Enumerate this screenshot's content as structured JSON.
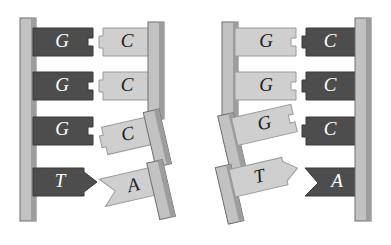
{
  "figure": {
    "background_color": "#ffffff"
  },
  "palette": {
    "backbone_face": "#b9b9b9",
    "backbone_edge": "#8d8d8d",
    "backbone_outline": "#6e6e6e",
    "base_dark": "#4d4d4d",
    "base_dark_outline": "#3a3a3a",
    "base_light": "#cfcfcf",
    "base_light_outline": "#9a9a9a",
    "label_on_dark": "#ffffff",
    "label_on_light": "#1c1c1c"
  },
  "groups": [
    {
      "id": "left-fragment",
      "name": "left-dna-fragment",
      "backbones": [
        {
          "id": "left-outer-backbone",
          "name": "backbone-left-outer",
          "state": "intact",
          "tilt_deg": 0
        },
        {
          "id": "left-inner-backbone-top",
          "name": "backbone-left-inner-top",
          "state": "intact",
          "tilt_deg": 0
        },
        {
          "id": "left-inner-backbone-frag-3",
          "name": "backbone-fragment-row3",
          "state": "detached",
          "tilt_deg": -14
        },
        {
          "id": "left-inner-backbone-frag-4",
          "name": "backbone-fragment-row4",
          "state": "detached",
          "tilt_deg": -14
        }
      ],
      "rows": [
        {
          "row": 1,
          "state": "paired",
          "tilt_deg": 0,
          "left": {
            "base": "G",
            "shade": "dark",
            "connector": "notch"
          },
          "right": {
            "base": "C",
            "shade": "light",
            "connector": "tab"
          }
        },
        {
          "row": 2,
          "state": "paired",
          "tilt_deg": 0,
          "left": {
            "base": "G",
            "shade": "dark",
            "connector": "notch"
          },
          "right": {
            "base": "C",
            "shade": "light",
            "connector": "tab"
          }
        },
        {
          "row": 3,
          "state": "separated",
          "tilt_deg": -14,
          "left": {
            "base": "G",
            "shade": "dark",
            "connector": "notch"
          },
          "right": {
            "base": "C",
            "shade": "light",
            "connector": "tab"
          }
        },
        {
          "row": 4,
          "state": "separated",
          "tilt_deg": -14,
          "left": {
            "base": "T",
            "shade": "dark",
            "connector": "arrow-point"
          },
          "right": {
            "base": "A",
            "shade": "light",
            "connector": "v-notch"
          }
        }
      ]
    },
    {
      "id": "right-fragment",
      "name": "right-dna-fragment",
      "backbones": [
        {
          "id": "right-inner-backbone-top",
          "name": "backbone-right-inner-top",
          "state": "intact",
          "tilt_deg": 0
        },
        {
          "id": "right-inner-backbone-frag-3",
          "name": "backbone-fragment-row3",
          "state": "detached",
          "tilt_deg": -14
        },
        {
          "id": "right-inner-backbone-frag-4",
          "name": "backbone-fragment-row4",
          "state": "detached",
          "tilt_deg": -14
        },
        {
          "id": "right-outer-backbone",
          "name": "backbone-right-outer",
          "state": "intact",
          "tilt_deg": 0
        }
      ],
      "rows": [
        {
          "row": 1,
          "state": "paired",
          "tilt_deg": 0,
          "left": {
            "base": "G",
            "shade": "light",
            "connector": "notch"
          },
          "right": {
            "base": "C",
            "shade": "dark",
            "connector": "tab"
          }
        },
        {
          "row": 2,
          "state": "paired",
          "tilt_deg": 0,
          "left": {
            "base": "G",
            "shade": "light",
            "connector": "notch"
          },
          "right": {
            "base": "C",
            "shade": "dark",
            "connector": "tab"
          }
        },
        {
          "row": 3,
          "state": "separated",
          "tilt_deg": -14,
          "left": {
            "base": "G",
            "shade": "light",
            "connector": "notch"
          },
          "right": {
            "base": "C",
            "shade": "dark",
            "connector": "tab"
          }
        },
        {
          "row": 4,
          "state": "separated",
          "tilt_deg": -14,
          "left": {
            "base": "T",
            "shade": "light",
            "connector": "arrow-point"
          },
          "right": {
            "base": "A",
            "shade": "dark",
            "connector": "v-notch"
          }
        }
      ]
    }
  ],
  "labels": {
    "g1_left": "G",
    "c1_left": "C",
    "g2_left": "G",
    "c2_left": "C",
    "g3_left": "G",
    "c3_left": "C",
    "t4_left": "T",
    "a4_left": "A",
    "g1_right": "G",
    "c1_right": "C",
    "g2_right": "G",
    "c2_right": "C",
    "g3_right": "G",
    "c3_right": "C",
    "t4_right": "T",
    "a4_right": "A"
  }
}
